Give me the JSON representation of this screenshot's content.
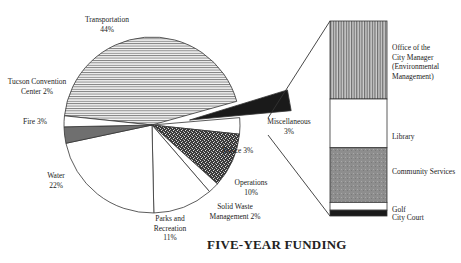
{
  "chart_data": {
    "type": "pie",
    "title": "FIVE-YEAR FUNDING",
    "slices": [
      {
        "name": "Transportation",
        "value": 44,
        "label_lines": [
          "Transportation",
          "44%"
        ],
        "pattern": "hstripe"
      },
      {
        "name": "Miscellaneous",
        "value": 3,
        "label_lines": [
          "Miscellaneous",
          "3%"
        ],
        "pattern": "black",
        "exploded": true
      },
      {
        "name": "Police",
        "value": 3,
        "label_lines": [
          "Police 3%"
        ],
        "pattern": "white"
      },
      {
        "name": "Operations",
        "value": 10,
        "label_lines": [
          "Operations",
          "10%"
        ],
        "pattern": "dark-stipple"
      },
      {
        "name": "Solid Waste Management",
        "value": 2,
        "label_lines": [
          "Solid Waste",
          "Management 2%"
        ],
        "pattern": "white"
      },
      {
        "name": "Parks and Recreation",
        "value": 11,
        "label_lines": [
          "Parks and",
          "Recreation",
          "11%"
        ],
        "pattern": "white"
      },
      {
        "name": "Water",
        "value": 22,
        "label_lines": [
          "Water",
          "22%"
        ],
        "pattern": "white"
      },
      {
        "name": "Fire",
        "value": 3,
        "label_lines": [
          "Fire 3%"
        ],
        "pattern": "gray"
      },
      {
        "name": "Tucson Convention Center",
        "value": 2,
        "label_lines": [
          "Tucson Convention",
          "Center 2%"
        ],
        "pattern": "white"
      }
    ],
    "breakdown": {
      "of": "Miscellaneous",
      "type": "stacked-bar",
      "segments": [
        {
          "name": "Office of the City Manager (Environmental Management)",
          "label_lines": [
            "Office of the",
            "City Manager",
            "(Environmental",
            "Management)"
          ],
          "share": 0.4,
          "pattern": "vstripe"
        },
        {
          "name": "Library",
          "label_lines": [
            "Library"
          ],
          "share": 0.25,
          "pattern": "white"
        },
        {
          "name": "Community Services",
          "label_lines": [
            "Community Services"
          ],
          "share": 0.28,
          "pattern": "gray-stipple"
        },
        {
          "name": "Golf",
          "label_lines": [
            "Golf"
          ],
          "share": 0.04,
          "pattern": "white"
        },
        {
          "name": "City Court",
          "label_lines": [
            "City Court"
          ],
          "share": 0.03,
          "pattern": "black"
        }
      ]
    }
  }
}
